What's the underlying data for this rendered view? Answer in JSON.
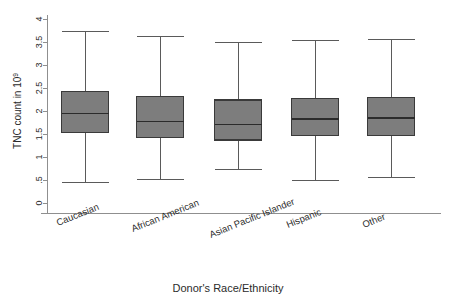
{
  "chart_data": {
    "type": "box",
    "title": "",
    "xlabel": "Donor's Race/Ethnicity",
    "ylabel": "TNC count in 10",
    "ylabel_superscript": "9",
    "categories": [
      "Caucasian",
      "African American",
      "Asian Pacific Islander",
      "Hispanic",
      "Other"
    ],
    "ylim": [
      0,
      4
    ],
    "ytick_labels": [
      "0",
      ".5",
      "1",
      "1.5",
      "2",
      "2.5",
      "3",
      "3.5",
      "4"
    ],
    "ytick_values": [
      0,
      0.5,
      1,
      1.5,
      2,
      2.5,
      3,
      3.5,
      4
    ],
    "grid": false,
    "legend": "none",
    "boxes": [
      {
        "category": "Caucasian",
        "whisker_low": 0.45,
        "q1": 1.53,
        "median": 1.95,
        "q3": 2.42,
        "whisker_high": 3.72
      },
      {
        "category": "African American",
        "whisker_low": 0.52,
        "q1": 1.42,
        "median": 1.77,
        "q3": 2.31,
        "whisker_high": 3.63
      },
      {
        "category": "Asian Pacific Islander",
        "whisker_low": 0.73,
        "q1": 1.37,
        "median": 1.71,
        "q3": 2.24,
        "whisker_high": 3.48
      },
      {
        "category": "Hispanic",
        "whisker_low": 0.48,
        "q1": 1.46,
        "median": 1.82,
        "q3": 2.28,
        "whisker_high": 3.53
      },
      {
        "category": "Other",
        "whisker_low": 0.55,
        "q1": 1.46,
        "median": 1.85,
        "q3": 2.29,
        "whisker_high": 3.55
      }
    ],
    "colors": {
      "box_fill": "#7d7d7d",
      "box_edge": "#3a3a3a",
      "median": "#2b2b2b",
      "whisker": "#5a5a5a",
      "axis": "#8f8f8f",
      "text": "#2b2b2b",
      "background": "#ffffff"
    }
  }
}
